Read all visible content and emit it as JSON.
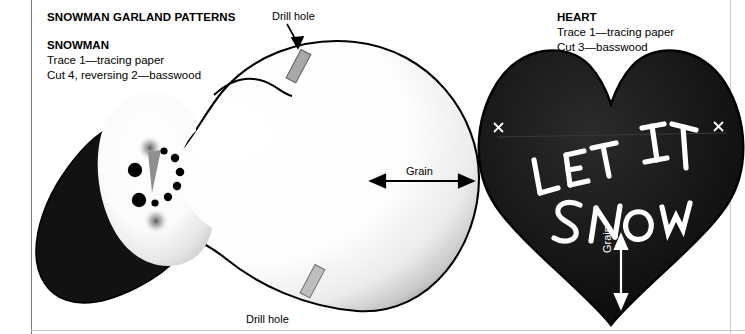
{
  "document": {
    "title": "SNOWMAN GARLAND PATTERNS"
  },
  "snowman": {
    "subhead": "SNOWMAN",
    "trace_line": "Trace 1—tracing paper",
    "cut_line": "Cut 4, reversing 2—basswood",
    "drill_hole_top_label": "Drill hole",
    "drill_hole_bottom_label": "Drill hole",
    "grain_label": "Grain",
    "face": {
      "eye_count": 2,
      "nose": "carrot-nose",
      "mouth_dot_count": 6,
      "blush_count": 2
    }
  },
  "heart": {
    "subhead": "HEART",
    "trace_line": "Trace 1—tracing paper",
    "cut_line": "Cut 3—basswood",
    "lettering_line1": "LET IT",
    "lettering_line2": "SNOW",
    "grain_label": "Grain",
    "mark_left": "×",
    "mark_right": "×"
  },
  "colors": {
    "ink": "#000000",
    "paper": "#ffffff",
    "rule_dark": "#7b7b7b",
    "rule_light": "#c9c9c9",
    "drill_hole_fill": "#a8a8a8",
    "nose_fill": "#8f8f8f",
    "heart_fill": "#101010",
    "lettering": "#ffffff"
  }
}
